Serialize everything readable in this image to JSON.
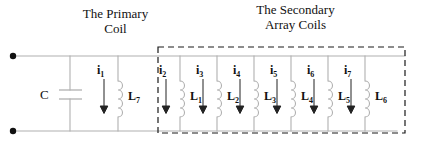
{
  "diagram": {
    "type": "electrical-circuit-schematic",
    "titles": [
      {
        "id": "primary",
        "line1": "The Primary",
        "line2": "Coil"
      },
      {
        "id": "secondary",
        "line1": "The Secondary",
        "line2": "Array Coils"
      }
    ],
    "capacitor": {
      "label": "C"
    },
    "primary_branch": {
      "current": "i",
      "current_sub": "1",
      "inductor": "L",
      "inductor_sub": "7"
    },
    "secondary_branches": [
      {
        "current": "i",
        "current_sub": "2",
        "inductor": "L",
        "inductor_sub": "1"
      },
      {
        "current": "i",
        "current_sub": "3",
        "inductor": "L",
        "inductor_sub": "2"
      },
      {
        "current": "i",
        "current_sub": "4",
        "inductor": "L",
        "inductor_sub": "3"
      },
      {
        "current": "i",
        "current_sub": "5",
        "inductor": "L",
        "inductor_sub": "4"
      },
      {
        "current": "i",
        "current_sub": "6",
        "inductor": "L",
        "inductor_sub": "5"
      },
      {
        "current": "i",
        "current_sub": "7",
        "inductor": "L",
        "inductor_sub": "6"
      }
    ],
    "terminals": [
      {
        "id": "top-left-terminal"
      },
      {
        "id": "bottom-left-terminal"
      }
    ],
    "colors": {
      "wire": "#b0b0b0",
      "ink": "#111111",
      "dashed_box": "#1a1a1a",
      "background": "#ffffff"
    }
  }
}
